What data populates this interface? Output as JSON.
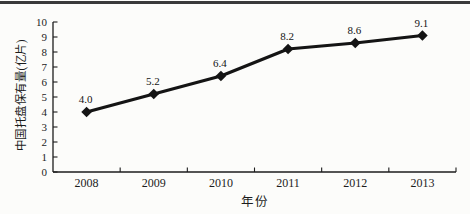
{
  "page": {
    "background": "#fcfcfa",
    "top_rule_color": "#3a3a3a"
  },
  "chart_data": {
    "type": "line",
    "categories": [
      "2008",
      "2009",
      "2010",
      "2011",
      "2012",
      "2013"
    ],
    "values": [
      4.0,
      5.2,
      6.4,
      8.2,
      8.6,
      9.1
    ],
    "point_labels": [
      "4.0",
      "5.2",
      "6.4",
      "8.2",
      "8.6",
      "9.1"
    ],
    "xlabel": "年份",
    "ylabel": "中国托盘保有量(亿片)",
    "ylim": [
      0,
      10
    ],
    "yticks": [
      "0",
      "1",
      "2",
      "3",
      "4",
      "5",
      "6",
      "7",
      "8",
      "9",
      "10"
    ],
    "grid": false,
    "legend": "none",
    "marker": "diamond",
    "line_color": "#141414",
    "marker_color": "#141414",
    "axis_color": "#1c1c1c",
    "text_color": "#1c1c1c"
  }
}
